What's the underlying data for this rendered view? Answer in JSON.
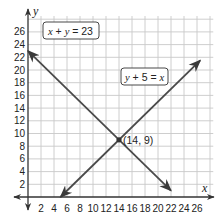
{
  "chart_data": {
    "type": "line",
    "title": "",
    "xlabel": "x",
    "ylabel": "y",
    "xlim": [
      -2,
      28
    ],
    "ylim": [
      -2,
      28
    ],
    "grid": true,
    "grid_step": 2,
    "x_ticks": [
      2,
      4,
      6,
      8,
      10,
      12,
      14,
      16,
      18,
      20,
      22,
      24,
      26
    ],
    "y_ticks": [
      2,
      4,
      6,
      8,
      10,
      12,
      14,
      16,
      18,
      20,
      22,
      24,
      26
    ],
    "series": [
      {
        "name": "x + y = 23",
        "label": "x + y = 23",
        "equation": "x + y = 23",
        "color": "#4a4a4a",
        "x": [
          0,
          22
        ],
        "y": [
          23,
          1
        ],
        "arrows": "both"
      },
      {
        "name": "y + 5 = x",
        "label": "y + 5 = x",
        "equation": "y + 5 = x",
        "color": "#4a4a4a",
        "x": [
          5,
          26.5
        ],
        "y": [
          0,
          21.5
        ],
        "arrows": "both"
      }
    ],
    "annotations": [
      {
        "text": "(14, 9)",
        "x": 14,
        "y": 9,
        "type": "intersection-point"
      },
      {
        "text": "x + y = 23",
        "x": 8,
        "y": 22,
        "type": "line-label"
      },
      {
        "text": "y + 5 = x",
        "x": 20,
        "y": 18,
        "type": "line-label"
      }
    ]
  },
  "labels": {
    "x_axis": "x",
    "y_axis": "y",
    "line1": {
      "lhs_a": "x",
      "op": " + ",
      "lhs_b": "y",
      "eq": " = ",
      "rhs": "23"
    },
    "line2": {
      "lhs_a": "y",
      "op": " + 5",
      "eq": " = ",
      "rhs": "x"
    },
    "intersection": "(14, 9)"
  },
  "colors": {
    "grid": "#c8c8c8",
    "axis": "#333333",
    "line": "#4a4a4a"
  }
}
